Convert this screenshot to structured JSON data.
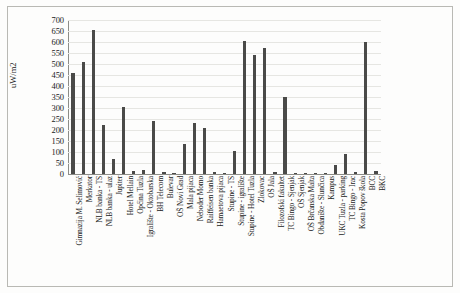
{
  "chart_data": {
    "type": "bar",
    "title": "",
    "subtitle": "",
    "xlabel": "",
    "ylabel": "uW/m2",
    "ylim": [
      0,
      700
    ],
    "ytick_step": 50,
    "yticks": [
      700,
      650,
      600,
      550,
      500,
      450,
      400,
      350,
      300,
      250,
      200,
      150,
      100,
      50,
      0
    ],
    "grid": true,
    "legend": false,
    "bar_color": "#4a4a48",
    "categories": [
      "Gimnazija M. Selimović",
      "Merkator",
      "NLB banka - TS",
      "NLB banka - ulaz",
      "Jupiter",
      "Hotel Mellain",
      "Općina Tuzla",
      "Igralište - Oktobarska",
      "BH Telecom",
      "Bulevar",
      "OŠ Novi Grad",
      "Mala pijaca",
      "Neboder Momo",
      "Raiffeisen banka",
      "Hamaetova pijaca",
      "Stupine - TS",
      "Stupine - igralište",
      "Stupine - Hotel Tuzla",
      "Zlokovac",
      "OŠ Jala",
      "Filozofski fakultet",
      "TC Bingo - Sjenjak",
      "OŠ Sjenjak",
      "OŠ Brčanska Malta",
      "Obdanište - Slunčica",
      "Kampus",
      "UKC Tuzla - parking",
      "TC Bingo - Irac",
      "Kosta Popov škola",
      "BCC",
      "BKC"
    ],
    "values": [
      460,
      510,
      655,
      225,
      70,
      305,
      15,
      20,
      240,
      10,
      5,
      135,
      230,
      210,
      10,
      5,
      105,
      605,
      540,
      575,
      10,
      350,
      5,
      5,
      5,
      5,
      40,
      90,
      10,
      600,
      15
    ]
  }
}
